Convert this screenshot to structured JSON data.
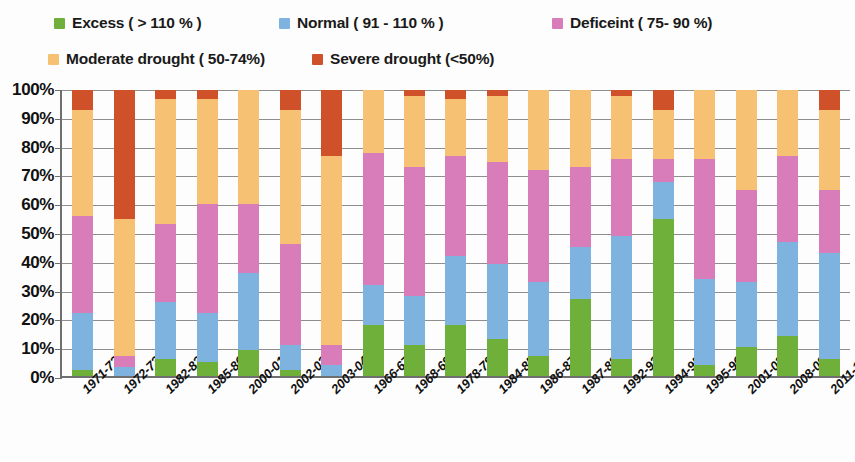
{
  "legend": {
    "items": [
      {
        "label": "Excess ( > 110 % )",
        "color": "#6FB03A",
        "key": "excess"
      },
      {
        "label": "Normal ( 91 - 110 % )",
        "color": "#7EB3E0",
        "key": "normal"
      },
      {
        "label": "Deficeint ( 75- 90 %)",
        "color": "#D87DBA",
        "key": "deficient"
      },
      {
        "label": "Moderate drought ( 50-74%)",
        "color": "#F6C173",
        "key": "moderate"
      },
      {
        "label": "Severe drought (<50%)",
        "color": "#CE5129",
        "key": "severe"
      }
    ]
  },
  "chart_data": {
    "type": "bar",
    "stacked": true,
    "stack_total": 100,
    "title": "",
    "xlabel": "",
    "ylabel": "",
    "ylim": [
      0,
      100
    ],
    "grid": true,
    "legend_position": "top",
    "y_ticks": [
      "0%",
      "10%",
      "20%",
      "30%",
      "40%",
      "50%",
      "60%",
      "70%",
      "80%",
      "90%",
      "100%"
    ],
    "y_tick_values": [
      0,
      10,
      20,
      30,
      40,
      50,
      60,
      70,
      80,
      90,
      100
    ],
    "categories": [
      "1971-72",
      "1972-73",
      "1982-83",
      "1985-86",
      "2000-01",
      "2002-03",
      "2003-04",
      "1966-67",
      "1968-69",
      "1978-79",
      "1984-85",
      "1986-87",
      "1987-88",
      "1992-93",
      "1994-95",
      "1995-96",
      "2001-02",
      "2008-09",
      "2011-12"
    ],
    "series": [
      {
        "name": "Excess ( > 110 % )",
        "color": "#6FB03A",
        "values": [
          2,
          0,
          6,
          5,
          9,
          2,
          0,
          18,
          11,
          18,
          13,
          7,
          27,
          6,
          55,
          4,
          10,
          14,
          6
        ]
      },
      {
        "name": "Normal ( 91 - 110 % )",
        "color": "#7EB3E0",
        "values": [
          20,
          3,
          20,
          17,
          27,
          9,
          4,
          14,
          17,
          24,
          26,
          26,
          18,
          43,
          13,
          30,
          23,
          33,
          37
        ]
      },
      {
        "name": "Deficeint ( 75- 90 %)",
        "color": "#D87DBA",
        "values": [
          34,
          4,
          27,
          38,
          24,
          35,
          7,
          46,
          45,
          35,
          36,
          39,
          28,
          27,
          8,
          42,
          32,
          30,
          22
        ]
      },
      {
        "name": "Moderate drought ( 50-74%)",
        "color": "#F6C173",
        "values": [
          37,
          48,
          44,
          37,
          40,
          47,
          66,
          22,
          25,
          20,
          23,
          28,
          27,
          22,
          17,
          24,
          35,
          23,
          28
        ]
      },
      {
        "name": "Severe drought (<50%)",
        "color": "#CE5129",
        "values": [
          7,
          45,
          3,
          3,
          0,
          7,
          23,
          0,
          2,
          3,
          2,
          0,
          0,
          2,
          7,
          0,
          0,
          0,
          7
        ]
      }
    ]
  }
}
